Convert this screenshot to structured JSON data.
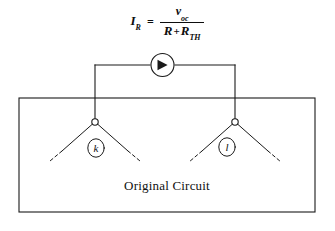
{
  "figure": {
    "title_equation": {
      "lhs_symbol": "I",
      "lhs_subscript": "R",
      "equals": "=",
      "numerator_symbol": "v",
      "numerator_subscript": "oc",
      "denominator_first": "R",
      "denominator_operator": "+",
      "denominator_second_symbol": "R",
      "denominator_second_subscript": "TH"
    },
    "box": {
      "caption": "Original Circuit"
    },
    "nodes": [
      {
        "id": "k",
        "label": "k"
      },
      {
        "id": "l",
        "label": "l"
      }
    ],
    "source": {
      "type": "current-source",
      "icon": "arrow-right-in-circle"
    },
    "colors": {
      "line": "#1a1a1a",
      "text": "#111111",
      "background": "#ffffff"
    }
  }
}
